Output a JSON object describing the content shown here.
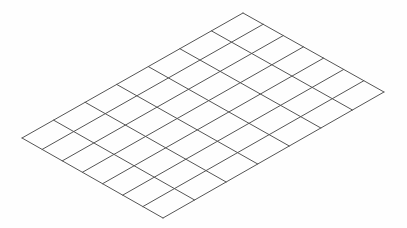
{
  "diagram": {
    "type": "isometric-grid",
    "rows": 7,
    "cols": 7,
    "corners": {
      "left": [
        22,
        138
      ],
      "top": [
        243,
        13
      ],
      "right": [
        384,
        92
      ],
      "bottom": [
        163,
        218
      ]
    },
    "colors": {
      "background": "#fefefe",
      "line": "#555555"
    },
    "line_width": 1
  }
}
